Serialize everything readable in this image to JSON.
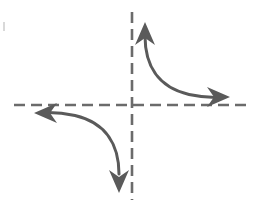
{
  "figure": {
    "title": "Hyperbola branches with dashed coordinate axes",
    "width": 263,
    "height": 209,
    "background_color": "#ffffff",
    "stroke_color": "#5a5a5a",
    "axis_color": "#6b6b6b",
    "stroke_width": 3,
    "axis_stroke_width": 2.6,
    "axis_dash_pattern": "11 6",
    "origin": {
      "x": 132,
      "y": 105
    }
  },
  "axes": {
    "horizontal": {
      "name": "x-axis",
      "x1": 14,
      "y1": 105,
      "x2": 248,
      "y2": 105,
      "style": "dashed"
    },
    "vertical": {
      "name": "y-axis",
      "x1": 132,
      "y1": 12,
      "x2": 132,
      "y2": 200,
      "style": "dashed"
    }
  },
  "curves": [
    {
      "name": "upper-right-branch",
      "quadrant": "I",
      "path": "M 145 38 C 145 66, 158 88, 190 95 C 205 98, 213 98, 220 97.5",
      "start_point": {
        "x": 145,
        "y": 38
      },
      "end_point": {
        "x": 220,
        "y": 97
      }
    },
    {
      "name": "lower-left-branch",
      "quadrant": "III",
      "path": "M 119 172 C 119 144, 106 122, 74 115 C 59 112, 51 112, 44 112.5",
      "start_point": {
        "x": 119,
        "y": 172
      },
      "end_point": {
        "x": 44,
        "y": 112
      }
    }
  ],
  "arrowheads": [
    {
      "name": "arrowhead-up",
      "direction": "up",
      "tip": {
        "x": 145,
        "y": 24
      },
      "rotation": 0
    },
    {
      "name": "arrowhead-right",
      "direction": "right",
      "tip": {
        "x": 228,
        "y": 97
      },
      "rotation": 90
    },
    {
      "name": "arrowhead-left",
      "direction": "left",
      "tip": {
        "x": 36,
        "y": 113
      },
      "rotation": 270
    },
    {
      "name": "arrowhead-down",
      "direction": "down",
      "tip": {
        "x": 119,
        "y": 190
      },
      "rotation": 180
    }
  ],
  "marks": [
    {
      "name": "edge-artifact",
      "x": 3,
      "y": 22,
      "width": 2,
      "height": 9,
      "color": "#d9d9d9"
    }
  ]
}
